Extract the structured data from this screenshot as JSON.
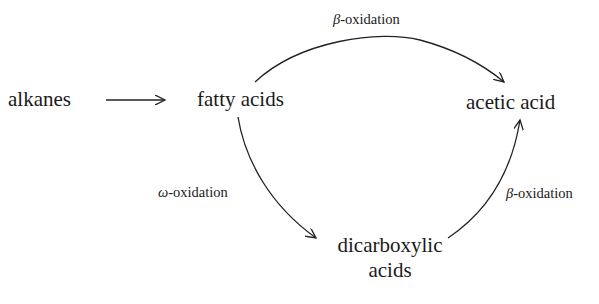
{
  "diagram": {
    "type": "metabolic-pathway",
    "nodes": {
      "alkanes": "alkanes",
      "fatty_acids": "fatty acids",
      "acetic_acid": "acetic acid",
      "dicarboxylic_line1": "dicarboxylic",
      "dicarboxylic_line2": "acids"
    },
    "edges": [
      {
        "from": "alkanes",
        "to": "fatty acids",
        "label": ""
      },
      {
        "from": "fatty acids",
        "to": "acetic acid",
        "label": "β-oxidation",
        "label_greek": "β",
        "label_rest": "-oxidation"
      },
      {
        "from": "fatty acids",
        "to": "dicarboxylic acids",
        "label": "ω-oxidation",
        "label_greek": "ω",
        "label_rest": "-oxidation"
      },
      {
        "from": "dicarboxylic acids",
        "to": "acetic acid",
        "label": "β-oxidation",
        "label_greek": "β",
        "label_rest": "-oxidation"
      }
    ],
    "stroke_color": "#222222"
  }
}
